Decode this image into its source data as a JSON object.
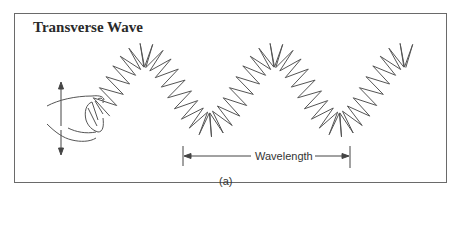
{
  "figure": {
    "title": "Transverse Wave",
    "wavelength_label": "Wavelength",
    "caption": "(a)"
  },
  "colors": {
    "line": "#555555",
    "frame": "#6a6a6a",
    "text": "#2a2a2a"
  }
}
